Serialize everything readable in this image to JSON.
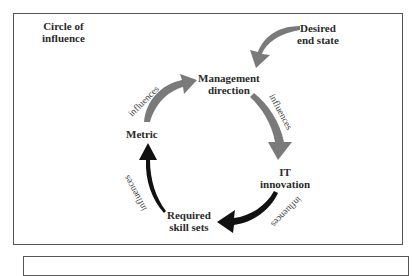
{
  "diagram": {
    "title_lines": [
      "Circle of",
      "influence"
    ],
    "nodes": [
      {
        "id": "desired-end-state",
        "lines": [
          "Desired",
          "end state"
        ]
      },
      {
        "id": "management-direction",
        "lines": [
          "Management",
          "direction"
        ]
      },
      {
        "id": "it-innovation",
        "lines": [
          "IT",
          "innovation"
        ]
      },
      {
        "id": "required-skill-sets",
        "lines": [
          "Required",
          "skill sets"
        ]
      },
      {
        "id": "metric",
        "lines": [
          "Metric"
        ]
      }
    ],
    "edges": [
      {
        "from": "desired-end-state",
        "to": "management-direction",
        "label": "",
        "color": "#7a7a7a"
      },
      {
        "from": "management-direction",
        "to": "it-innovation",
        "label": "influences",
        "color": "#7a7a7a"
      },
      {
        "from": "it-innovation",
        "to": "required-skill-sets",
        "label": "influences",
        "color": "#111111"
      },
      {
        "from": "required-skill-sets",
        "to": "metric",
        "label": "influences",
        "color": "#111111"
      },
      {
        "from": "metric",
        "to": "management-direction",
        "label": "influences",
        "color": "#7a7a7a"
      }
    ],
    "colors": {
      "gray_arrow": "#7a7a7a",
      "black_arrow": "#111111",
      "border": "#555555"
    }
  }
}
